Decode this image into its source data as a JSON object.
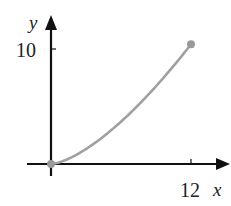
{
  "chart_data": {
    "type": "line",
    "title": "",
    "xlabel": "x",
    "ylabel": "y",
    "x_ticks": [
      {
        "value": 12,
        "label": "12"
      }
    ],
    "y_ticks": [
      {
        "value": 10,
        "label": "10"
      }
    ],
    "xlim": [
      -2,
      15.4
    ],
    "ylim": [
      -1,
      13
    ],
    "grid": false,
    "legend": null,
    "series": [
      {
        "name": "curve",
        "color": "#a0a0a0",
        "x": [
          0,
          1,
          2,
          3,
          4,
          5,
          6,
          7,
          8,
          9,
          10,
          11,
          12
        ],
        "y": [
          0,
          0.24,
          0.68,
          1.25,
          1.92,
          2.69,
          3.54,
          4.46,
          5.44,
          6.5,
          7.61,
          8.77,
          10.5
        ],
        "endpoints": [
          {
            "x": 0,
            "y": 0
          },
          {
            "x": 12,
            "y": 10.5
          }
        ]
      }
    ]
  },
  "labels": {
    "y_axis": "y",
    "x_axis": "x",
    "y_tick_10": "10",
    "x_tick_12": "12"
  },
  "colors": {
    "axis": "#111111",
    "curve": "#a0a0a0",
    "point": "#999999"
  }
}
